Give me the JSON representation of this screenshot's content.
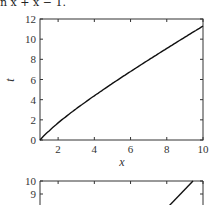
{
  "caption": "n x + x − 1.",
  "chart_data": [
    {
      "type": "line",
      "title": "",
      "xlabel": "x",
      "ylabel": "t",
      "xlim": [
        1,
        10
      ],
      "ylim": [
        0,
        12
      ],
      "xticks": [
        2,
        4,
        6,
        8,
        10
      ],
      "yticks": [
        0,
        2,
        4,
        6,
        8,
        10,
        12
      ],
      "grid": false,
      "series": [
        {
          "name": "t = ln x + x - 1",
          "x": [
            1,
            1.5,
            2,
            3,
            4,
            5,
            6,
            7,
            8,
            9,
            10
          ],
          "values": [
            0,
            0.91,
            1.69,
            3.1,
            4.39,
            5.61,
            6.79,
            7.95,
            9.08,
            10.2,
            11.3
          ]
        }
      ]
    },
    {
      "type": "line",
      "title": "",
      "xlabel": "",
      "ylabel": "",
      "xlim": [
        1,
        10
      ],
      "ylim": [
        null,
        10
      ],
      "yticks": [
        9,
        10
      ],
      "grid": false,
      "note": "partially visible (cropped at bottom)",
      "series": [
        {
          "name": "line",
          "x": [
            8.3,
            9.6
          ],
          "values": [
            8.1,
            10
          ]
        }
      ]
    }
  ]
}
